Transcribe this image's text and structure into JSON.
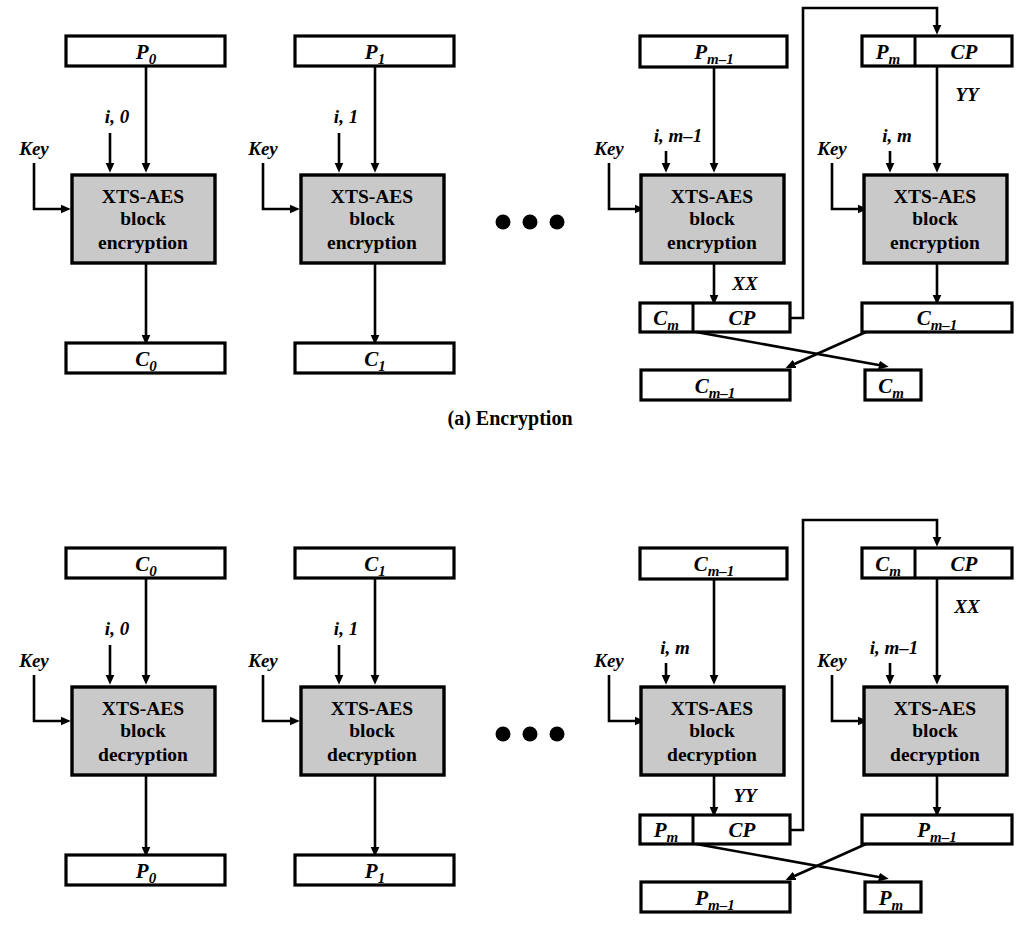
{
  "figure": {
    "caption_a": "(a) Encryption",
    "ellipsis": "• • •",
    "colors": {
      "block_fill": "#c9c9c9",
      "box_fill": "#ffffff",
      "stroke": "#000000"
    }
  },
  "encryption": {
    "caption": "(a) Encryption",
    "block_label_line1": "XTS-AES",
    "block_label_line2": "block",
    "block_label_line3": "encryption",
    "key_label": "Key",
    "stages": [
      {
        "name": "stage-0",
        "input_box": {
          "base": "P",
          "sub": "0"
        },
        "tweak": "i, 0",
        "key": "Key",
        "output_box": {
          "base": "C",
          "sub": "0"
        }
      },
      {
        "name": "stage-1",
        "input_box": {
          "base": "P",
          "sub": "1"
        },
        "tweak": "i, 1",
        "key": "Key",
        "output_box": {
          "base": "C",
          "sub": "1"
        }
      },
      {
        "name": "stage-m-minus-1",
        "input_box": {
          "base": "P",
          "sub": "m–1"
        },
        "tweak": "i, m–1",
        "key": "Key",
        "intermediate_label": "XX",
        "output_split_box": {
          "left_base": "C",
          "left_sub": "m",
          "right": "CP"
        },
        "final_box": {
          "base": "C",
          "sub": "m–1"
        }
      },
      {
        "name": "stage-m",
        "input_split_box": {
          "left_base": "P",
          "left_sub": "m",
          "right": "CP"
        },
        "intermediate_label": "YY",
        "tweak": "i, m",
        "key": "Key",
        "output_box": {
          "base": "C",
          "sub": "m–1"
        },
        "final_box": {
          "base": "C",
          "sub": "m"
        }
      }
    ]
  },
  "decryption": {
    "block_label_line1": "XTS-AES",
    "block_label_line2": "block",
    "block_label_line3": "decryption",
    "key_label": "Key",
    "stages": [
      {
        "name": "stage-0",
        "input_box": {
          "base": "C",
          "sub": "0"
        },
        "tweak": "i, 0",
        "key": "Key",
        "output_box": {
          "base": "P",
          "sub": "0"
        }
      },
      {
        "name": "stage-1",
        "input_box": {
          "base": "C",
          "sub": "1"
        },
        "tweak": "i, 1",
        "key": "Key",
        "output_box": {
          "base": "P",
          "sub": "1"
        }
      },
      {
        "name": "stage-m",
        "input_box": {
          "base": "C",
          "sub": "m–1"
        },
        "tweak": "i, m",
        "key": "Key",
        "intermediate_label": "YY",
        "output_split_box": {
          "left_base": "P",
          "left_sub": "m",
          "right": "CP"
        },
        "final_box": {
          "base": "P",
          "sub": "m–1"
        }
      },
      {
        "name": "stage-m-minus-1",
        "input_split_box": {
          "left_base": "C",
          "left_sub": "m",
          "right": "CP"
        },
        "intermediate_label": "XX",
        "tweak": "i, m–1",
        "key": "Key",
        "output_box": {
          "base": "P",
          "sub": "m–1"
        },
        "final_box": {
          "base": "P",
          "sub": "m"
        }
      }
    ]
  }
}
